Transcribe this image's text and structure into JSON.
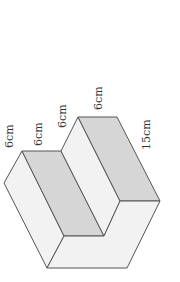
{
  "figure": {
    "colors": {
      "light_face": "#f2f2f2",
      "dark_face": "#d6d6d6",
      "edge": "#555555",
      "text": "#333333"
    },
    "labels": [
      {
        "id": "dim-1",
        "text": "6cm"
      },
      {
        "id": "dim-2",
        "text": "6cm"
      },
      {
        "id": "dim-3",
        "text": "6cm"
      },
      {
        "id": "dim-4",
        "text": "6cm"
      },
      {
        "id": "dim-5",
        "text": "15cm"
      }
    ]
  }
}
